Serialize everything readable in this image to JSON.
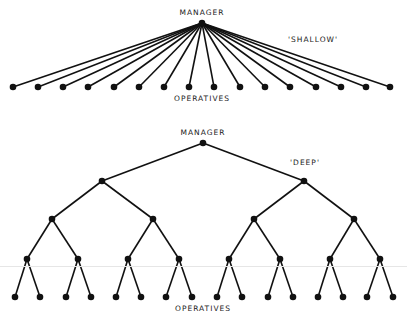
{
  "diagram": {
    "colors": {
      "line": "#111111",
      "node": "#111111",
      "text": "#1a1a1a",
      "background": "#ffffff"
    },
    "shallow": {
      "title": "'SHALLOW'",
      "root_label": "MANAGER",
      "leaf_label": "OPERATIVES",
      "root": [
        202,
        23
      ],
      "leaves_y": 87,
      "leaves_x": [
        13,
        38,
        63,
        88,
        114,
        139,
        164,
        189,
        214,
        240,
        265,
        290,
        316,
        341,
        366,
        390
      ],
      "label_positions": {
        "root_label": [
          202,
          9
        ],
        "title": [
          313,
          36
        ],
        "leaf_label": [
          202,
          95
        ]
      }
    },
    "deep": {
      "title": "'DEEP'",
      "root_label": "MANAGER",
      "leaf_label": "OPERATIVES",
      "levels": [
        {
          "y": 143,
          "x": [
            203
          ]
        },
        {
          "y": 181,
          "x": [
            102,
            304
          ]
        },
        {
          "y": 219,
          "x": [
            52,
            153,
            254,
            354
          ]
        },
        {
          "y": 259,
          "x": [
            27,
            78,
            128,
            179,
            229,
            280,
            330,
            380
          ]
        },
        {
          "y": 297,
          "x": [
            15,
            40,
            66,
            91,
            116,
            141,
            166,
            192,
            217,
            242,
            268,
            293,
            318,
            343,
            367,
            393
          ]
        }
      ],
      "label_positions": {
        "root_label": [
          203,
          129
        ],
        "title": [
          305,
          159
        ],
        "leaf_label": [
          203,
          305
        ]
      }
    }
  }
}
